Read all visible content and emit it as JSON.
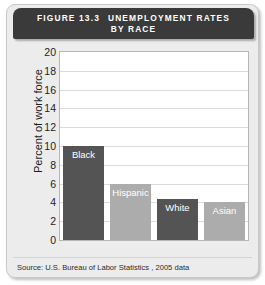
{
  "figure": {
    "number_label": "FIGURE 13.3",
    "title_line1": "UNEMPLOYMENT RATES",
    "title_line2": "BY RACE",
    "source": "Source: U.S. Bureau of Labor Statistics , 2005 data"
  },
  "colors": {
    "header_bar": "#3a3a3a",
    "card_background": "#ececec",
    "plot_background": "#ffffff",
    "gridline": "#dcdcdc",
    "bar_dark": "#545454",
    "bar_light": "#acacac",
    "bar_label_text": "#ffffff"
  },
  "chart_data": {
    "type": "bar",
    "xlabel": "",
    "ylabel": "Percent of work force",
    "categories": [
      "Black",
      "Hispanic",
      "White",
      "Asian"
    ],
    "values": [
      10.0,
      6.0,
      4.4,
      4.0
    ],
    "ylim": [
      0,
      20
    ],
    "ytick_step": 2,
    "yticks": [
      "20",
      "18",
      "16",
      "14",
      "12",
      "10",
      "8",
      "6",
      "4",
      "2",
      "0"
    ],
    "grid": true,
    "legend": false,
    "bar_colors": [
      "#545454",
      "#acacac",
      "#545454",
      "#acacac"
    ],
    "labels_inside_bars": true,
    "source": "Source: U.S. Bureau of Labor Statistics , 2005 data"
  }
}
